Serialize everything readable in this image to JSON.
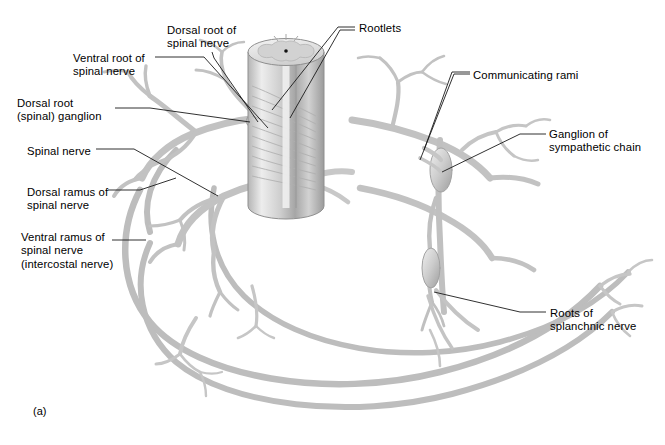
{
  "figure": {
    "caption": "(a)",
    "style": "grayscale anatomical illustration"
  },
  "palette": {
    "nerve_light": "#e9e9e9",
    "nerve_mid": "#c9c9c9",
    "nerve_dark": "#9a9a9a",
    "nerve_outline": "#8c8c8c",
    "cord_light": "#efefef",
    "cord_mid": "#c4c4c4",
    "cord_dark": "#8f8f8f",
    "gray_matter": "#d5d5d5",
    "leader_line": "#1a1a1a",
    "text": "#000000",
    "background": "#ffffff"
  },
  "labels": [
    {
      "id": "dorsal-root",
      "text": "Dorsal root of\nspinal nerve",
      "x": 167,
      "y": 24
    },
    {
      "id": "rootlets",
      "text": "Rootlets",
      "x": 359,
      "y": 22
    },
    {
      "id": "ventral-root",
      "text": "Ventral root of\nspinal nerve",
      "x": 73,
      "y": 52
    },
    {
      "id": "communicating-rami",
      "text": "Communicating rami",
      "x": 473,
      "y": 69
    },
    {
      "id": "dorsal-root-ganglion",
      "text": "Dorsal root\n(spinal) ganglion",
      "x": 17,
      "y": 97
    },
    {
      "id": "ganglion-sympathetic-chain",
      "text": "Ganglion of\nsympathetic chain",
      "x": 549,
      "y": 128
    },
    {
      "id": "spinal-nerve",
      "text": "Spinal nerve",
      "x": 27,
      "y": 145
    },
    {
      "id": "dorsal-ramus",
      "text": "Dorsal ramus of\nspinal nerve",
      "x": 27,
      "y": 186
    },
    {
      "id": "ventral-ramus",
      "text": "Ventral ramus of\nspinal nerve\n(intercostal nerve)",
      "x": 21,
      "y": 231
    },
    {
      "id": "roots-splanchnic-nerve",
      "text": "Roots of\nsplanchnic nerve",
      "x": 550,
      "y": 307
    }
  ],
  "structures": [
    {
      "name": "spinal-cord",
      "description": "vertical cylinder, cut cross-section on top showing butterfly gray matter and central canal"
    },
    {
      "name": "cord-cross-section",
      "description": "oval top face with H-shaped gray matter and dark central canal dot"
    },
    {
      "name": "dorsal-rootlets",
      "description": "fan of fine rootlets from posterior cord to dorsal root"
    },
    {
      "name": "ventral-rootlets",
      "description": "fan of fine rootlets from anterior cord to ventral root"
    },
    {
      "name": "dorsal-root-ganglion",
      "description": "spindle-shaped swelling on dorsal root"
    },
    {
      "name": "spinal-nerve-trunk",
      "description": "short trunk lateral to ganglion dividing into rami"
    },
    {
      "name": "dorsal-ramus",
      "description": "posteriorly directed branch with terminal twigs"
    },
    {
      "name": "ventral-ramus",
      "description": "long anterior intercostal nerve arcs sweeping right"
    },
    {
      "name": "communicating-rami",
      "description": "two short connections between spinal nerve and sympathetic ganglion"
    },
    {
      "name": "sympathetic-chain",
      "description": "vertical chain of spindle ganglia right of the cord"
    },
    {
      "name": "splanchnic-roots",
      "description": "descending branches from lower sympathetic ganglia"
    }
  ]
}
